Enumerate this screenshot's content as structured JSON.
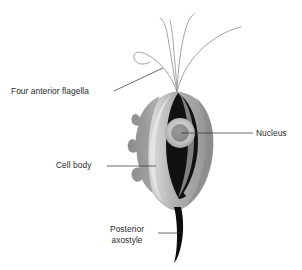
{
  "figure": {
    "background_color": "#ffffff"
  },
  "labels": {
    "flagella": "Four anterior flagella",
    "nucleus": "Nucleus",
    "cell_body": "Cell body",
    "axostyle_line1": "Posterior",
    "axostyle_line2": "axostyle"
  },
  "colors": {
    "text": "#2b2b2b",
    "leader_line": "#3a3a3a",
    "cell_body_light": "#d8d8d8",
    "cell_body_mid": "#a8a8a8",
    "cell_body_dark": "#8a8a8a",
    "membrane_lobe": "#8e8e8e",
    "inner_dark": "#111111",
    "nucleus_fill": "#8f8f8f",
    "nucleus_halo": "#c9c9c9",
    "flagella_stroke": "#9a9a9a",
    "axostyle_fill": "#0d0d0d"
  },
  "parts": {
    "flagella_count": 4,
    "flagella_origin": "cell apex",
    "axostyle_shape": "curved tapering spine",
    "cell_body_shape": "oval",
    "nucleus_shape": "circle"
  },
  "leaders": {
    "flagella": "from text right edge up-right to flagella bundle",
    "nucleus": "horizontal from nucleus to right text",
    "cell_body": "horizontal from text to left cell body edge",
    "axostyle": "horizontal from text to axostyle"
  }
}
